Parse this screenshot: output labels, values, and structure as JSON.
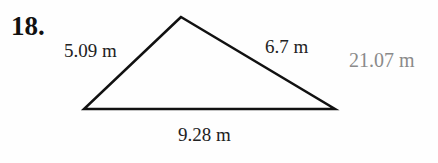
{
  "problem": {
    "number": "18.",
    "sides": {
      "left": "5.09 m",
      "right": "6.7 m",
      "base": "9.28 m"
    },
    "answer": "21.07 m"
  },
  "triangle": {
    "apex": [
      181,
      17
    ],
    "left": [
      84,
      109
    ],
    "right": [
      335,
      109
    ]
  }
}
